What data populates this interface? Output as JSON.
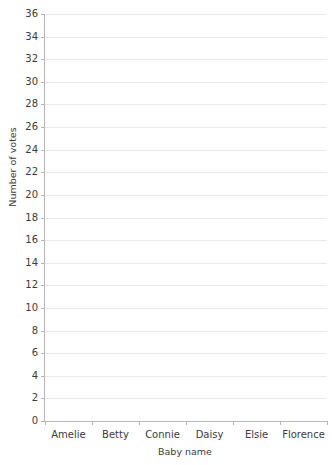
{
  "chart_data": {
    "type": "bar",
    "title": "",
    "xlabel": "Baby name",
    "ylabel": "Number of votes",
    "categories": [
      "Amelie",
      "Betty",
      "Connie",
      "Daisy",
      "Elsie",
      "Florence"
    ],
    "values": [
      null,
      null,
      null,
      null,
      null,
      null
    ],
    "series": [
      {
        "name": "Number of votes",
        "values": [
          null,
          null,
          null,
          null,
          null,
          null
        ]
      }
    ],
    "ylim": [
      0,
      36
    ],
    "y_tick_step": 2,
    "y_ticks": [
      0,
      2,
      4,
      6,
      8,
      10,
      12,
      14,
      16,
      18,
      20,
      22,
      24,
      26,
      28,
      30,
      32,
      34,
      36
    ],
    "y_tick_labels": [
      "0",
      "2",
      "4",
      "6",
      "8",
      "10",
      "12",
      "14",
      "16",
      "18",
      "20",
      "22",
      "24",
      "26",
      "28",
      "30",
      "32",
      "34",
      "36"
    ],
    "grid": true,
    "grid_axis": "y",
    "legend": false,
    "legend_position": "none",
    "plot_empty": true,
    "annotations": [],
    "colors": {
      "background": "#ffffff",
      "gridline": "#e9e9e9",
      "axis_line": "#b6b6b6",
      "text": "#3b3b3b",
      "title_text": "#2f2f2f"
    }
  }
}
